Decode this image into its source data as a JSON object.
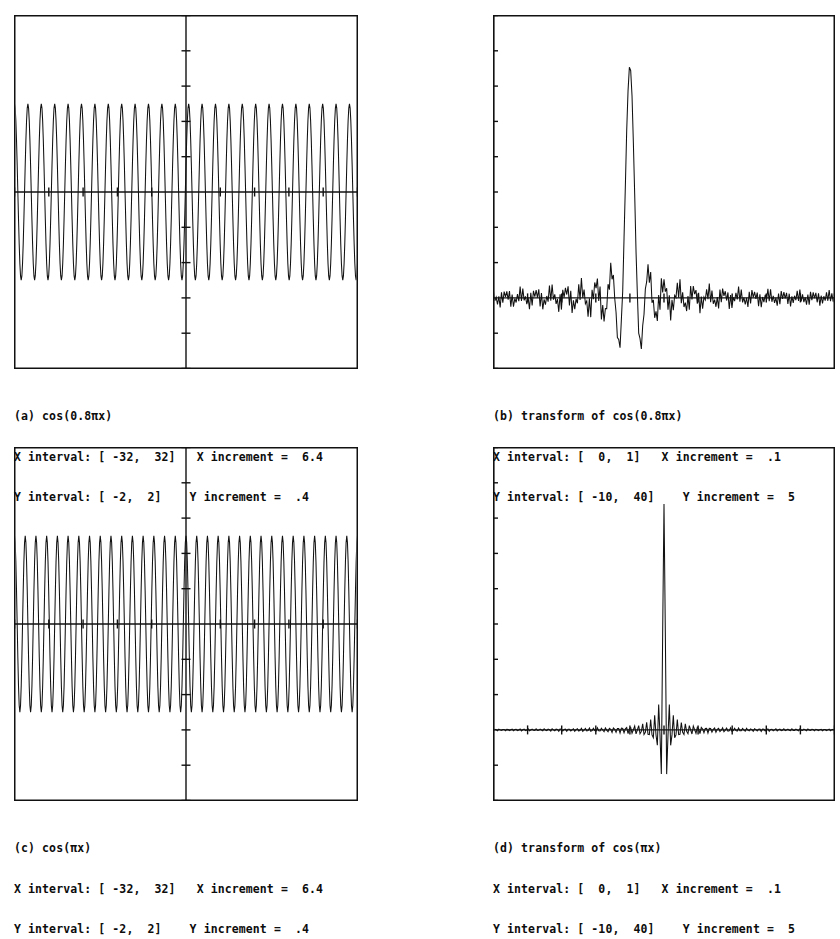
{
  "figure": {
    "background": "#ffffff",
    "ink": "#111111",
    "width": 840,
    "height": 864
  },
  "panels": [
    {
      "id": "a",
      "caption": {
        "title": "(a) cos(0.8πx)",
        "x_interval_label": "X interval: [ -32,  32]",
        "x_increment_label": "X increment =  6.4",
        "y_interval_label": "Y interval: [ -2,  2]",
        "y_increment_label": "Y increment =  .4"
      },
      "frame": {
        "x": 14,
        "y": 15,
        "width": 344,
        "height": 354
      },
      "axes": {
        "x_axis_at_y_value": 0,
        "y_axis_at_x_value": 0,
        "x_tick_count": 10,
        "y_tick_count": 10,
        "x_tick_length": 9,
        "y_tick_length": 9
      },
      "chart_data": {
        "type": "line",
        "title": "(a) cos(0.8πx)",
        "function": "cos(0.8*pi*x)",
        "xlabel": "",
        "ylabel": "",
        "xlim": [
          -32,
          32
        ],
        "ylim": [
          -2,
          2
        ],
        "x_increment": 6.4,
        "y_increment": 0.4,
        "amplitude": 1.0,
        "frequency_cycles_over_range": 25.6,
        "samples": 512,
        "grid": false,
        "legend": "none"
      }
    },
    {
      "id": "b",
      "caption": {
        "title": "(b) transform of cos(0.8πx)",
        "x_interval_label": "X interval: [  0,  1]",
        "x_increment_label": "X increment =  .1",
        "y_interval_label": "Y interval: [ -10,  40]",
        "y_increment_label": "Y increment =  5"
      },
      "frame": {
        "x": 493,
        "y": 15,
        "width": 342,
        "height": 354
      },
      "axes": {
        "x_axis_at_y_value": 0,
        "y_axis_at_x_value": 0,
        "x_tick_count": 10,
        "y_tick_count": 10,
        "x_tick_length": 9,
        "y_tick_length": 9
      },
      "chart_data": {
        "type": "line",
        "title": "(b) transform of cos(0.8πx)",
        "function": "dirichlet kernel, peak at x=0.4",
        "xlabel": "",
        "ylabel": "",
        "xlim": [
          0,
          1
        ],
        "ylim": [
          -10,
          40
        ],
        "x_increment": 0.1,
        "y_increment": 5,
        "peak_x": 0.4,
        "peak_y": 33,
        "sidelobe_min_y": -12,
        "noise_floor_amplitude": 1.6,
        "samples": 256,
        "grid": false,
        "legend": "none"
      }
    },
    {
      "id": "c",
      "caption": {
        "title": "(c) cos(πx)",
        "x_interval_label": "X interval: [ -32,  32]",
        "x_increment_label": "X increment =  6.4",
        "y_interval_label": "Y interval: [ -2,  2]",
        "y_increment_label": "Y increment =  .4"
      },
      "frame": {
        "x": 14,
        "y": 447,
        "width": 344,
        "height": 354
      },
      "axes": {
        "x_axis_at_y_value": 0,
        "y_axis_at_x_value": 0,
        "x_tick_count": 10,
        "y_tick_count": 10,
        "x_tick_length": 9,
        "y_tick_length": 9
      },
      "chart_data": {
        "type": "line",
        "title": "(c) cos(πx)",
        "function": "cos(pi*x)",
        "xlabel": "",
        "ylabel": "",
        "xlim": [
          -32,
          32
        ],
        "ylim": [
          -2,
          2
        ],
        "x_increment": 6.4,
        "y_increment": 0.4,
        "amplitude": 1.0,
        "frequency_cycles_over_range": 32,
        "samples": 512,
        "grid": false,
        "legend": "none"
      }
    },
    {
      "id": "d",
      "caption": {
        "title": "(d) transform of cos(πx)",
        "x_interval_label": "X interval: [  0,  1]",
        "x_increment_label": "X increment =  .1",
        "y_interval_label": "Y interval: [ -10,  40]",
        "y_increment_label": "Y increment =  5"
      },
      "frame": {
        "x": 493,
        "y": 447,
        "width": 342,
        "height": 354
      },
      "axes": {
        "x_axis_at_y_value": 0,
        "y_axis_at_x_value": 0,
        "x_tick_count": 10,
        "y_tick_count": 10,
        "x_tick_length": 9,
        "y_tick_length": 9
      },
      "chart_data": {
        "type": "line",
        "title": "(d) transform of cos(πx)",
        "function": "single spike at x=0.5",
        "xlabel": "",
        "ylabel": "",
        "xlim": [
          0,
          1
        ],
        "ylim": [
          -10,
          40
        ],
        "x_increment": 0.1,
        "y_increment": 5,
        "peak_x": 0.5,
        "peak_y": 32,
        "sidelobe_min_y": -0.4,
        "noise_floor_amplitude": 0.05,
        "samples": 256,
        "grid": false,
        "legend": "none"
      }
    }
  ]
}
